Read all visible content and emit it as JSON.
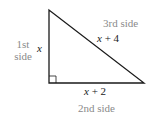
{
  "figure": {
    "type": "right-triangle",
    "vertices": {
      "top": [
        49,
        10
      ],
      "right_angle": [
        49,
        83
      ],
      "bottom_right": [
        144,
        83
      ]
    },
    "right_angle_marker": true,
    "colors": {
      "stroke": "#1a1a1a",
      "side_name_text": "#8a8a8a",
      "expression_text": "#1a1a1a"
    }
  },
  "sides": {
    "first": {
      "name_line1": "1st",
      "name_line2": "side",
      "expression": "x"
    },
    "second": {
      "name": "2nd side",
      "expression_var": "x",
      "expression_op": "+ 2"
    },
    "third": {
      "name": "3rd side",
      "expression_var": "x",
      "expression_op": "+ 4"
    }
  }
}
